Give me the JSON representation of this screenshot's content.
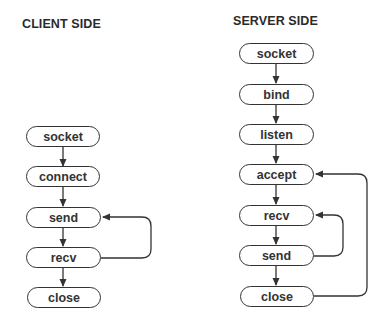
{
  "client": {
    "title": "CLIENT SIDE",
    "nodes": [
      "socket",
      "connect",
      "send",
      "recv",
      "close"
    ]
  },
  "server": {
    "title": "SERVER SIDE",
    "nodes": [
      "socket",
      "bind",
      "listen",
      "accept",
      "recv",
      "send",
      "close"
    ]
  },
  "edges": {
    "client": [
      {
        "from": "socket",
        "to": "connect"
      },
      {
        "from": "connect",
        "to": "send"
      },
      {
        "from": "send",
        "to": "recv"
      },
      {
        "from": "recv",
        "to": "close"
      },
      {
        "from": "recv",
        "to": "send",
        "type": "loop"
      }
    ],
    "server": [
      {
        "from": "socket",
        "to": "bind"
      },
      {
        "from": "bind",
        "to": "listen"
      },
      {
        "from": "listen",
        "to": "accept"
      },
      {
        "from": "accept",
        "to": "recv"
      },
      {
        "from": "recv",
        "to": "send"
      },
      {
        "from": "send",
        "to": "close"
      },
      {
        "from": "send",
        "to": "recv",
        "type": "loop"
      },
      {
        "from": "close",
        "to": "accept",
        "type": "loop"
      }
    ]
  },
  "colors": {
    "stroke": "#333333",
    "text": "#333333",
    "background": "#ffffff"
  }
}
